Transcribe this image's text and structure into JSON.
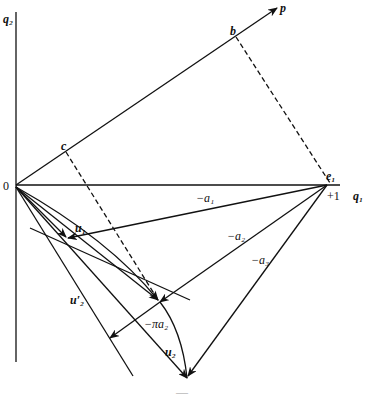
{
  "diagram": {
    "colors": {
      "ink": "#111111",
      "background": "#ffffff"
    },
    "axes": {
      "vertical_label": "q₂",
      "horizontal_label": "q₁",
      "origin_label": "0",
      "unit_label": "+1"
    },
    "points": {
      "p": "p",
      "b": "b",
      "c": "c",
      "e1": "e₁",
      "u1": "u₁",
      "u2": "u₂",
      "u2_prime": "u′₂"
    },
    "vector_labels": {
      "a1": "−a₁",
      "a2": "−a₂",
      "a3": "−a₃",
      "pi_a2": "−πa₂"
    },
    "caption": "—"
  }
}
